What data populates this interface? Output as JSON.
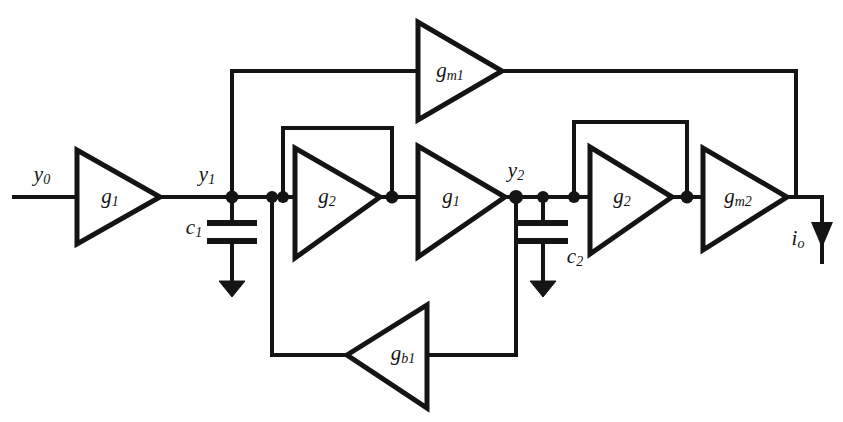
{
  "figure": {
    "kind": "circuit-schematic",
    "width": 843,
    "height": 422,
    "background_color": "#ffffff",
    "line_color": "#141414"
  },
  "amplifiers": [
    {
      "id": "g1-input",
      "base": "g",
      "sub": "1",
      "label": "g1",
      "orientation": "right"
    },
    {
      "id": "g2-first",
      "base": "g",
      "sub": "2",
      "label": "g2",
      "orientation": "right"
    },
    {
      "id": "g1-second",
      "base": "g",
      "sub": "1",
      "label": "g1",
      "orientation": "right"
    },
    {
      "id": "g2-second",
      "base": "g",
      "sub": "2",
      "label": "g2",
      "orientation": "right"
    },
    {
      "id": "gm1",
      "base": "g",
      "sub": "m1",
      "label": "gm1",
      "orientation": "right"
    },
    {
      "id": "gm2",
      "base": "g",
      "sub": "m2",
      "label": "gm2",
      "orientation": "right"
    },
    {
      "id": "gb1",
      "base": "g",
      "sub": "b1",
      "label": "gb1",
      "orientation": "left"
    }
  ],
  "capacitors": [
    {
      "id": "c1",
      "base": "c",
      "sub": "1",
      "label": "c1",
      "label_side": "left"
    },
    {
      "id": "c2",
      "base": "c",
      "sub": "2",
      "label": "c2",
      "label_side": "right"
    }
  ],
  "signals": [
    {
      "id": "y0",
      "base": "y",
      "sub": "0",
      "label": "y0",
      "role": "input"
    },
    {
      "id": "y1",
      "base": "y",
      "sub": "1",
      "label": "y1",
      "role": "internal-node"
    },
    {
      "id": "y2",
      "base": "y",
      "sub": "2",
      "label": "y2",
      "role": "internal-node"
    },
    {
      "id": "io",
      "base": "i",
      "sub": "o",
      "label": "io",
      "role": "output-current"
    }
  ],
  "grounds": [
    {
      "id": "gnd-c1"
    },
    {
      "id": "gnd-c2"
    }
  ]
}
